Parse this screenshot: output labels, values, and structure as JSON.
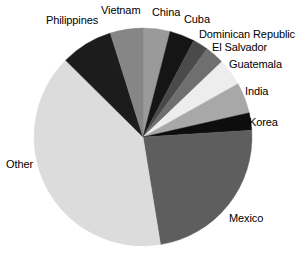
{
  "chart_data": {
    "type": "pie",
    "title": "",
    "subtitle": "",
    "xlabel": "",
    "ylabel": "",
    "legend_position": "none",
    "grid": false,
    "start_angle_deg": 0,
    "direction": "clockwise",
    "categories": [
      "China",
      "Cuba",
      "Dominican Republic",
      "El Salvador",
      "Guatemala",
      "India",
      "Korea",
      "Mexico",
      "Other",
      "Philippines",
      "Vietnam"
    ],
    "values": [
      3.9,
      3.6,
      2.2,
      2.8,
      3.9,
      4.4,
      2.5,
      22.8,
      38.9,
      7.5,
      4.7
    ],
    "units": "percent",
    "slices": [
      {
        "label": "China",
        "value": 3.9,
        "angle_deg": 14.0,
        "color": "#9a9a9a"
      },
      {
        "label": "Cuba",
        "value": 3.6,
        "angle_deg": 13.0,
        "color": "#151515"
      },
      {
        "label": "Dominican Republic",
        "value": 2.2,
        "angle_deg": 8.0,
        "color": "#4a4a4a"
      },
      {
        "label": "El Salvador",
        "value": 2.8,
        "angle_deg": 10.0,
        "color": "#6f6f6f"
      },
      {
        "label": "Guatemala",
        "value": 3.9,
        "angle_deg": 14.0,
        "color": "#ededed"
      },
      {
        "label": "India",
        "value": 4.4,
        "angle_deg": 16.0,
        "color": "#a8a8a8"
      },
      {
        "label": "Korea",
        "value": 2.5,
        "angle_deg": 9.0,
        "color": "#0d0d0d"
      },
      {
        "label": "Mexico",
        "value": 22.8,
        "angle_deg": 82.0,
        "color": "#5e5e5e"
      },
      {
        "label": "Other",
        "value": 38.9,
        "angle_deg": 140.0,
        "color": "#dcdcdc"
      },
      {
        "label": "Philippines",
        "value": 7.5,
        "angle_deg": 27.0,
        "color": "#1c1c1c"
      },
      {
        "label": "Vietnam",
        "value": 4.7,
        "angle_deg": 17.0,
        "color": "#868686"
      }
    ]
  },
  "labels": {
    "china": "China",
    "cuba": "Cuba",
    "dominican_republic": "Dominican Republic",
    "el_salvador": "El Salvador",
    "guatemala": "Guatemala",
    "india": "India",
    "korea": "Korea",
    "mexico": "Mexico",
    "other": "Other",
    "philippines": "Philippines",
    "vietnam": "Vietnam"
  },
  "colors": {
    "background": "#ffffff",
    "text": "#000000",
    "outline": "#c9c9c9"
  },
  "geometry": {
    "center_x": 143,
    "center_y": 137,
    "radius": 109
  }
}
